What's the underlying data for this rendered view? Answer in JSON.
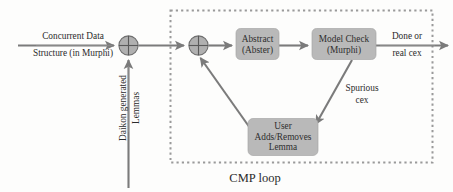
{
  "diagram": {
    "caption": "CMP loop",
    "colors": {
      "box_fill": "#b9b9b9",
      "arrow": "#7b7b7b",
      "text": "#2b2b2b",
      "loop_border": "#9a9a9a",
      "background": "#fdfdfc"
    },
    "nodes": [
      {
        "id": "abstract",
        "label_line1": "Abstract",
        "label_line2": "(Abster)",
        "label_line3": ""
      },
      {
        "id": "modelcheck",
        "label_line1": "Model Check",
        "label_line2": "(Murphi)",
        "label_line3": ""
      },
      {
        "id": "user",
        "label_line1": "User",
        "label_line2": "Adds/Removes",
        "label_line3": "Lemma"
      }
    ],
    "junctions": [
      {
        "id": "junction-1",
        "symbol": "cross-circle"
      },
      {
        "id": "junction-2",
        "symbol": "cross-circle"
      }
    ],
    "edge_labels": {
      "input_line1": "Concurrent Data",
      "input_line2": "Structure (in Murphi)",
      "daikon_line1": "Daikon generated",
      "daikon_line2": "Lemmas",
      "spurious_line1": "Spurious",
      "spurious_line2": "cex",
      "output_line1": "Done or",
      "output_line2": "real cex"
    }
  }
}
